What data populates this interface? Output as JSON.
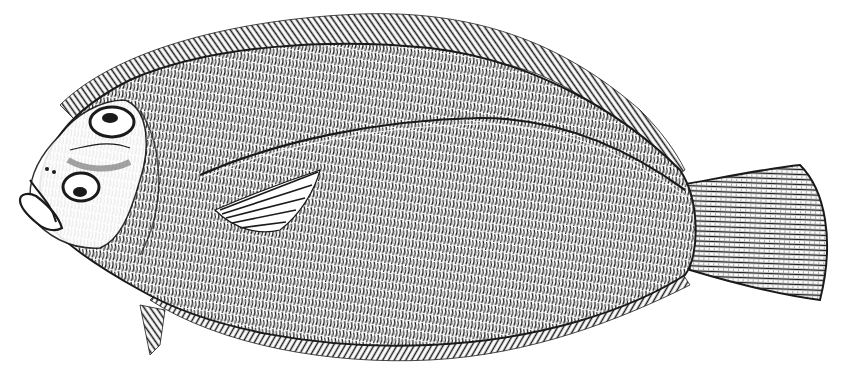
{
  "image": {
    "subject": "Engraved illustration of a flatfish (flounder), left-facing, eyed side up",
    "style": "woodcut engraving, black ink on white",
    "colors": {
      "background": "#ffffff",
      "ink": "#1a1a1a",
      "ink_light": "#4a4a4a"
    },
    "parts": [
      "head",
      "upper-eye",
      "lower-eye",
      "mouth",
      "body",
      "lateral-line",
      "pectoral-fin",
      "dorsal-fin",
      "anal-fin",
      "pelvic-fin",
      "caudal-fin"
    ]
  }
}
